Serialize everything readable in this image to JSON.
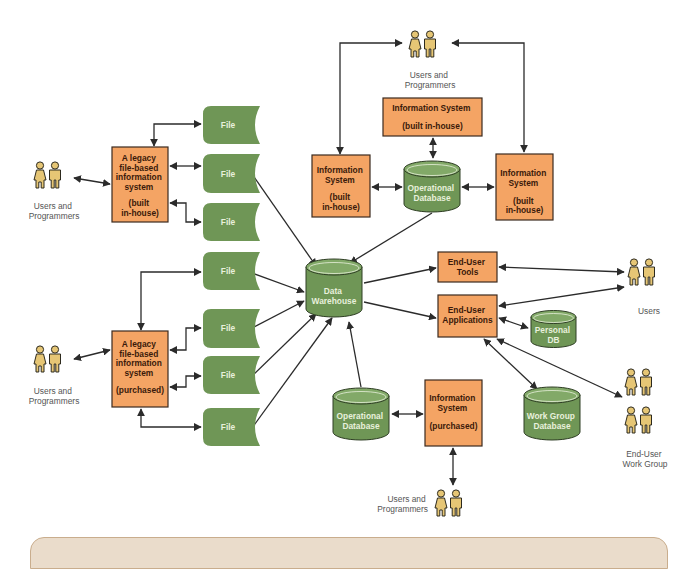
{
  "colors": {
    "box_fill": "#f4a464",
    "box_stroke": "#3b2a1e",
    "db_fill": "#6f9656",
    "db_stroke": "#2f3e25",
    "db_top": "#82a968",
    "person_fill": "#e6c675",
    "person_stroke": "#2d2a1e",
    "arrow": "#2b2b2b",
    "label": "#555555",
    "panel_fill": "#eadccb"
  },
  "nodes": {
    "legacy_inhouse": {
      "lines": [
        "A legacy",
        "file-based",
        "information",
        "system",
        "",
        "(built",
        "in-house)"
      ]
    },
    "legacy_purchased": {
      "lines": [
        "A legacy",
        "file-based",
        "information",
        "system",
        "",
        "(purchased)"
      ]
    },
    "is_top_center": {
      "lines": [
        "Information System",
        "",
        "(built in-house)"
      ]
    },
    "is_left": {
      "lines": [
        "Information",
        "System",
        "",
        "(built",
        "in-house)"
      ]
    },
    "is_right": {
      "lines": [
        "Information",
        "System",
        "",
        "(built",
        "in-house)"
      ]
    },
    "is_purchased": {
      "lines": [
        "Information",
        "System",
        "",
        "(purchased)"
      ]
    },
    "end_user_tools": {
      "lines": [
        "End-User",
        "Tools"
      ]
    },
    "end_user_apps": {
      "lines": [
        "End-User",
        "Applications"
      ]
    },
    "data_warehouse": {
      "lines": [
        "Data",
        "Warehouse"
      ]
    },
    "op_db_top": {
      "lines": [
        "Operational",
        "Database"
      ]
    },
    "op_db_bottom": {
      "lines": [
        "Operational",
        "Database"
      ]
    },
    "personal_db": {
      "lines": [
        "Personal",
        "DB"
      ]
    },
    "work_group_db": {
      "lines": [
        "Work Group",
        "Database"
      ]
    },
    "file_label": "File"
  },
  "actors": {
    "left_top": {
      "lines": [
        "Users and",
        "Programmers"
      ]
    },
    "left_bottom": {
      "lines": [
        "Users and",
        "Programmers"
      ]
    },
    "top": {
      "lines": [
        "Users and",
        "Programmers"
      ]
    },
    "bottom": {
      "lines": [
        "Users and",
        "Programmers"
      ]
    },
    "right_users": {
      "lines": [
        "Users"
      ]
    },
    "right_workgroup": {
      "lines": [
        "End-User",
        "Work Group"
      ]
    }
  }
}
